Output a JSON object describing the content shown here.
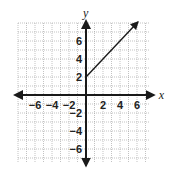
{
  "chart_data": {
    "type": "line",
    "title": "",
    "xlabel": "x",
    "ylabel": "y",
    "xlim": [
      -8,
      7.5
    ],
    "ylim": [
      -7.5,
      8
    ],
    "grid": true,
    "x_ticks": [
      -6,
      -4,
      -2,
      2,
      4,
      6
    ],
    "y_ticks": [
      6,
      4,
      2,
      -2,
      -4,
      -6
    ],
    "x_tick_labels": [
      "−6",
      "−4",
      "−2",
      "2",
      "4",
      "6"
    ],
    "y_tick_labels": [
      "6",
      "4",
      "2",
      "−2",
      "−4",
      "−6"
    ],
    "series": [
      {
        "name": "ray",
        "kind": "ray",
        "start": [
          0,
          2
        ],
        "end_arrow": [
          6.1,
          8.1
        ],
        "x": [
          0,
          6.1
        ],
        "y": [
          2,
          8.1
        ],
        "slope": 1,
        "start_closed": false,
        "color": "#1a1a1a"
      }
    ],
    "legend": null
  },
  "layout": {
    "origin_px": [
      86,
      95
    ],
    "unit_x_px": 8.5,
    "unit_y_px": 9,
    "colors": {
      "axis": "#1a1a1a",
      "grid": "#9a9a9a",
      "ray": "#1a1a1a",
      "background": "#ffffff"
    }
  }
}
